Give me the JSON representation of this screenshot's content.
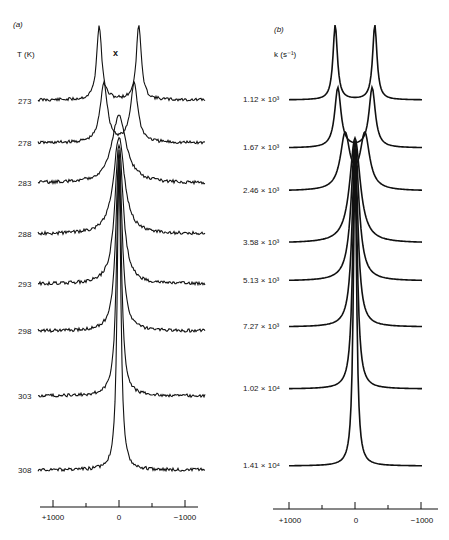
{
  "chart_data": [
    {
      "type": "line",
      "panel": "(a)",
      "title": "(a) Experimental spectra",
      "series_label_title": "T (K)",
      "annotation": "x",
      "xlabel": "",
      "ylabel": "",
      "xlim": [
        1200,
        -1200
      ],
      "x_ticks": [
        1000,
        500,
        0,
        -500,
        -1000
      ],
      "x_tick_labels": [
        "+1000",
        "0",
        "−1000"
      ],
      "grid": false,
      "series": [
        {
          "name": "273",
          "baseline_y": 100,
          "peaks": [
            {
              "x": -300,
              "amp": 75,
              "w": 90
            },
            {
              "x": 300,
              "amp": 75,
              "w": 90
            }
          ],
          "noise": true
        },
        {
          "name": "278",
          "baseline_y": 143,
          "peaks": [
            {
              "x": -230,
              "amp": 60,
              "w": 130
            },
            {
              "x": 230,
              "amp": 60,
              "w": 130
            }
          ],
          "noise": true
        },
        {
          "name": "283",
          "baseline_y": 183,
          "peaks": [
            {
              "x": 0,
              "amp": 68,
              "w": 260
            }
          ],
          "noise": true
        },
        {
          "name": "288",
          "baseline_y": 234,
          "peaks": [
            {
              "x": 0,
              "amp": 97,
              "w": 200
            }
          ],
          "noise": true
        },
        {
          "name": "293",
          "baseline_y": 284,
          "peaks": [
            {
              "x": 0,
              "amp": 140,
              "w": 150
            }
          ],
          "noise": true
        },
        {
          "name": "298",
          "baseline_y": 331,
          "peaks": [
            {
              "x": 0,
              "amp": 180,
              "w": 110
            }
          ],
          "noise": true
        },
        {
          "name": "303",
          "baseline_y": 396,
          "peaks": [
            {
              "x": 0,
              "amp": 240,
              "w": 85
            }
          ],
          "noise": true
        },
        {
          "name": "308",
          "baseline_y": 470,
          "peaks": [
            {
              "x": 0,
              "amp": 310,
              "w": 65
            }
          ],
          "noise": true
        }
      ]
    },
    {
      "type": "line",
      "panel": "(b)",
      "title": "(b) Simulated spectra",
      "series_label_title": "k (s⁻¹)",
      "xlabel": "",
      "ylabel": "",
      "xlim": [
        1200,
        -1200
      ],
      "x_ticks": [
        1000,
        500,
        0,
        -500,
        -1000
      ],
      "x_tick_labels": [
        "+1000",
        "0",
        "−1000"
      ],
      "grid": false,
      "series": [
        {
          "name": "1.12 × 10³",
          "k": 1120,
          "baseline_y": 100,
          "peaks": [
            {
              "x": -300,
              "amp": 75,
              "w": 80
            },
            {
              "x": 300,
              "amp": 75,
              "w": 80
            }
          ]
        },
        {
          "name": "1.67 × 10³",
          "k": 1670,
          "baseline_y": 148,
          "peaks": [
            {
              "x": -260,
              "amp": 60,
              "w": 115
            },
            {
              "x": 260,
              "amp": 60,
              "w": 115
            }
          ]
        },
        {
          "name": "2.46 × 10³",
          "k": 2460,
          "baseline_y": 191,
          "peaks": [
            {
              "x": -150,
              "amp": 55,
              "w": 170
            },
            {
              "x": 150,
              "amp": 55,
              "w": 170
            }
          ]
        },
        {
          "name": "3.58 × 10³",
          "k": 3580,
          "baseline_y": 243,
          "peaks": [
            {
              "x": 0,
              "amp": 105,
              "w": 190
            }
          ]
        },
        {
          "name": "5.13 × 10³",
          "k": 5130,
          "baseline_y": 281,
          "peaks": [
            {
              "x": 0,
              "amp": 140,
              "w": 140
            }
          ]
        },
        {
          "name": "7.27 × 10³",
          "k": 7270,
          "baseline_y": 327,
          "peaks": [
            {
              "x": 0,
              "amp": 180,
              "w": 105
            }
          ]
        },
        {
          "name": "1.02 × 10⁴",
          "k": 10200,
          "baseline_y": 389,
          "peaks": [
            {
              "x": 0,
              "amp": 240,
              "w": 80
            }
          ]
        },
        {
          "name": "1.41 × 10⁴",
          "k": 14100,
          "baseline_y": 466,
          "peaks": [
            {
              "x": 0,
              "amp": 305,
              "w": 60
            }
          ]
        }
      ]
    }
  ],
  "panel_a": {
    "tag": "(a)",
    "axis_title": "T (K)",
    "annotation": "x",
    "labels": [
      "273",
      "278",
      "283",
      "288",
      "293",
      "298",
      "303",
      "308"
    ],
    "tick_labels": {
      "left": "+1000",
      "mid": "0",
      "right": "−1000"
    }
  },
  "panel_b": {
    "tag": "(b)",
    "axis_title": "k (s⁻¹)",
    "labels": [
      "1.12 × 10³",
      "1.67 × 10³",
      "2.46 × 10³",
      "3.58 × 10³",
      "5.13 × 10³",
      "7.27 × 10³",
      "1.02 × 10⁴",
      "1.41 × 10⁴"
    ],
    "tick_labels": {
      "left": "+1000",
      "mid": "0",
      "right": "−1000"
    }
  }
}
